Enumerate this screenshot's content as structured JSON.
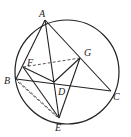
{
  "diagram": {
    "type": "geometry",
    "circle": {
      "cx": 67,
      "cy": 72,
      "r": 52
    },
    "points": {
      "A": {
        "x": 45,
        "y": 20,
        "label": "A",
        "lx": 39,
        "ly": 17
      },
      "B": {
        "x": 16,
        "y": 79,
        "label": "B",
        "lx": 4,
        "ly": 84
      },
      "C": {
        "x": 111,
        "y": 91,
        "label": "C",
        "lx": 113,
        "ly": 100
      },
      "D": {
        "x": 54,
        "y": 82,
        "label": "D",
        "lx": 58,
        "ly": 95
      },
      "E": {
        "x": 59,
        "y": 118,
        "label": "E",
        "lx": 55,
        "ly": 131
      },
      "F": {
        "x": 23,
        "y": 67,
        "label": "F",
        "lx": 27,
        "ly": 66
      },
      "G": {
        "x": 80,
        "y": 58,
        "label": "G",
        "lx": 84,
        "ly": 56
      }
    },
    "solid_segments": [
      "AB",
      "AC",
      "AE",
      "BC",
      "BD",
      "BE",
      "FD",
      "FE",
      "GD",
      "GE"
    ],
    "dashed_segments": [
      "FG",
      "BE2"
    ]
  }
}
